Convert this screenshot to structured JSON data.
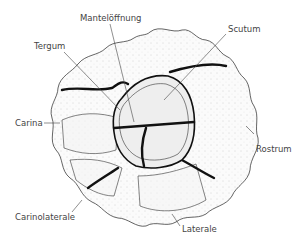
{
  "figure": {
    "labels": {
      "mantleopening": "Mantelöffnung",
      "scutum": "Scutum",
      "tergum": "Tergum",
      "carina": "Carina",
      "rostrum": "Rostrum",
      "carinolaterale": "Carinolaterale",
      "laterale": "Laterale"
    },
    "colors": {
      "line": "#222222",
      "label": "#444444",
      "background": "#ffffff"
    }
  }
}
